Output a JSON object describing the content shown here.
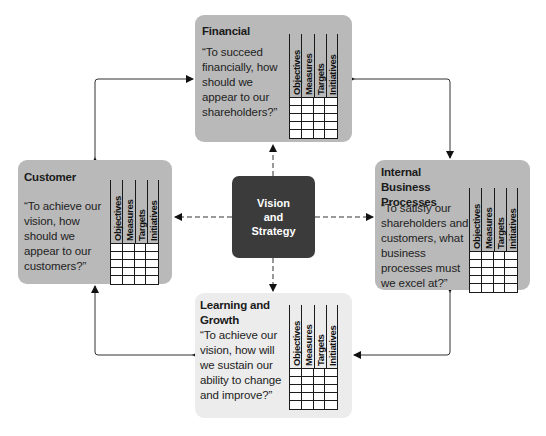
{
  "diagram": {
    "type": "balanced-scorecard",
    "center": {
      "label": "Vision\nand\nStrategy",
      "color": "#3b3b3b"
    },
    "grid_columns": [
      "Objectives",
      "Measures",
      "Targets",
      "Initiatives"
    ],
    "grid_rows": 5,
    "perspectives": [
      {
        "id": "financial",
        "title": "Financial",
        "question": "“To succeed financially, how should we appear to our shareholders?”",
        "color": "#b9b9b9"
      },
      {
        "id": "customer",
        "title": "Customer",
        "question": "“To achieve our vision, how should we appear to our customers?”",
        "color": "#b9b9b9"
      },
      {
        "id": "internal",
        "title": "Internal Business Processes",
        "question": "“To satisfy our shareholders and customers, what business processes must we excel at?”",
        "color": "#b9b9b9"
      },
      {
        "id": "learning",
        "title": "Learning and Growth",
        "question": "“To achieve our vision, how will we sustain our ability to change and improve?”",
        "color": "#ececec"
      }
    ],
    "connections": {
      "dashed": [
        "center-financial",
        "center-customer",
        "center-internal",
        "center-learning"
      ],
      "solid_bidirectional": [
        "customer-financial",
        "financial-internal",
        "internal-learning",
        "learning-customer"
      ]
    }
  }
}
